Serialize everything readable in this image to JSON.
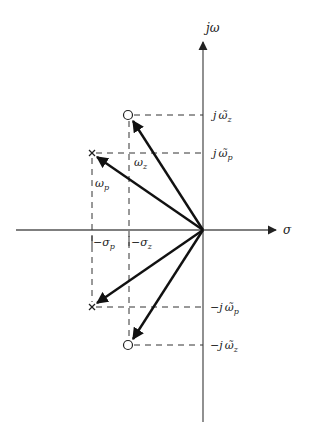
{
  "diagram": {
    "type": "s-plane pole-zero vector diagram",
    "colors": {
      "axis": "#555555",
      "vector": "#111111",
      "dashed": "#333333",
      "text": "#222222",
      "background": "#ffffff"
    },
    "axes": {
      "vertical_label": "jω",
      "horizontal_label": "σ"
    },
    "labels": {
      "j_omega_z": {
        "prefix": "j",
        "main": "ω̃",
        "sub": "z"
      },
      "j_omega_p": {
        "prefix": "j",
        "main": "ω̃",
        "sub": "p"
      },
      "neg_j_omega_p": {
        "prefix": "−j",
        "main": "ω̃",
        "sub": "p"
      },
      "neg_j_omega_z": {
        "prefix": "−j",
        "main": "ω̃",
        "sub": "z"
      },
      "omega_z": {
        "main": "ω",
        "sub": "z"
      },
      "omega_p": {
        "main": "ω",
        "sub": "p"
      },
      "neg_sigma_p": {
        "main": "−σ",
        "sub": "p"
      },
      "neg_sigma_z": {
        "main": "−σ",
        "sub": "z"
      }
    },
    "markers": [
      {
        "kind": "zero",
        "symbol": "○",
        "position": "upper"
      },
      {
        "kind": "pole",
        "symbol": "×",
        "position": "upper"
      },
      {
        "kind": "pole",
        "symbol": "×",
        "position": "lower"
      },
      {
        "kind": "zero",
        "symbol": "○",
        "position": "lower"
      }
    ]
  }
}
